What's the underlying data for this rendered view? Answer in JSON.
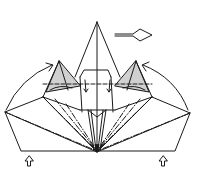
{
  "diagram": {
    "type": "origami-folding-step",
    "description": "Origami fold diagram: pyramid/crown form with fan of creases converging at bottom center, shaded side flaps, curved fold arrows, turn-over arrow and push-up arrows",
    "colors": {
      "line": "#1a1a1a",
      "shade": "#d0d0d0",
      "background": "#ffffff"
    },
    "symbols": [
      {
        "name": "turn-over-arrow",
        "position": "top-right"
      },
      {
        "name": "push-up-arrow-left",
        "position": "bottom-left"
      },
      {
        "name": "push-up-arrow-right",
        "position": "bottom-right"
      },
      {
        "name": "fold-arrow-left",
        "position": "left"
      },
      {
        "name": "fold-arrow-right",
        "position": "right"
      }
    ],
    "line_styles": [
      "solid",
      "dashed (valley)",
      "dash-dot (mountain)"
    ]
  }
}
